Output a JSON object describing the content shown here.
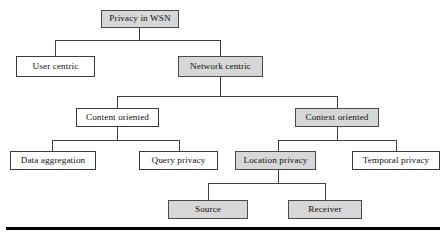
{
  "diagram": {
    "shaded_color": "#d7d7d7",
    "plain_color": "#ffffff",
    "border_color": "#3a3a3a",
    "line_color": "#3f3f3f",
    "rule_color": "#000000",
    "nodes": [
      {
        "id": "root",
        "label": "Privacy in WSN",
        "shaded": true
      },
      {
        "id": "user",
        "label": "User centric",
        "shaded": false
      },
      {
        "id": "network",
        "label": "Network centric",
        "shaded": true
      },
      {
        "id": "content",
        "label": "Content oriented",
        "shaded": false
      },
      {
        "id": "context",
        "label": "Context oriented",
        "shaded": true
      },
      {
        "id": "dataagg",
        "label": "Data aggregation",
        "shaded": false
      },
      {
        "id": "query",
        "label": "Query privacy",
        "shaded": false
      },
      {
        "id": "location",
        "label": "Location privacy",
        "shaded": true
      },
      {
        "id": "temporal",
        "label": "Temporal privacy",
        "shaded": false
      },
      {
        "id": "source",
        "label": "Source",
        "shaded": true
      },
      {
        "id": "receiver",
        "label": "Receiver",
        "shaded": true
      }
    ],
    "edges": [
      {
        "from": "root",
        "to": "user"
      },
      {
        "from": "root",
        "to": "network"
      },
      {
        "from": "network",
        "to": "content"
      },
      {
        "from": "network",
        "to": "context"
      },
      {
        "from": "content",
        "to": "dataagg"
      },
      {
        "from": "content",
        "to": "query"
      },
      {
        "from": "context",
        "to": "location"
      },
      {
        "from": "context",
        "to": "temporal"
      },
      {
        "from": "location",
        "to": "source"
      },
      {
        "from": "location",
        "to": "receiver"
      }
    ]
  }
}
